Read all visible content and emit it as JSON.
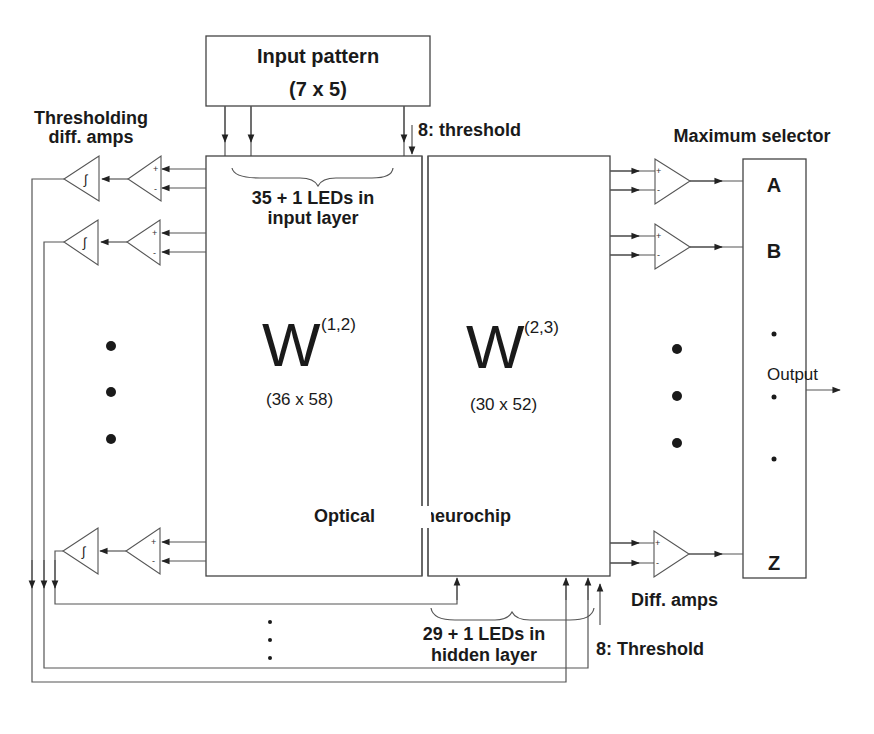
{
  "diagram": {
    "input_box": {
      "title": "Input pattern",
      "size": "(7 x 5)"
    },
    "top_threshold_label": "8: threshold",
    "left_amps_label_line1": "Thresholding",
    "left_amps_label_line2": "diff. amps",
    "input_leds_line1": "35 + 1 LEDs in",
    "input_leds_line2": "input layer",
    "w12": {
      "symbol": "W",
      "superscript": "(1,2)",
      "size": "(36 x 58)"
    },
    "w23": {
      "symbol": "W",
      "superscript": "(2,3)",
      "size": "(30 x 52)"
    },
    "chip_label_left": "Optical",
    "chip_label_right": "neurochip",
    "max_selector_label": "Maximum selector",
    "selector_outputs": [
      "A",
      "B",
      "Z"
    ],
    "output_label": "Output",
    "diff_amps_label": "Diff. amps",
    "hidden_leds_line1": "29 + 1 LEDs in",
    "hidden_leds_line2": "hidden layer",
    "bottom_threshold_label": "8: Threshold",
    "amp_signs": {
      "plus": "+",
      "minus": "-",
      "integral": "∫"
    }
  }
}
